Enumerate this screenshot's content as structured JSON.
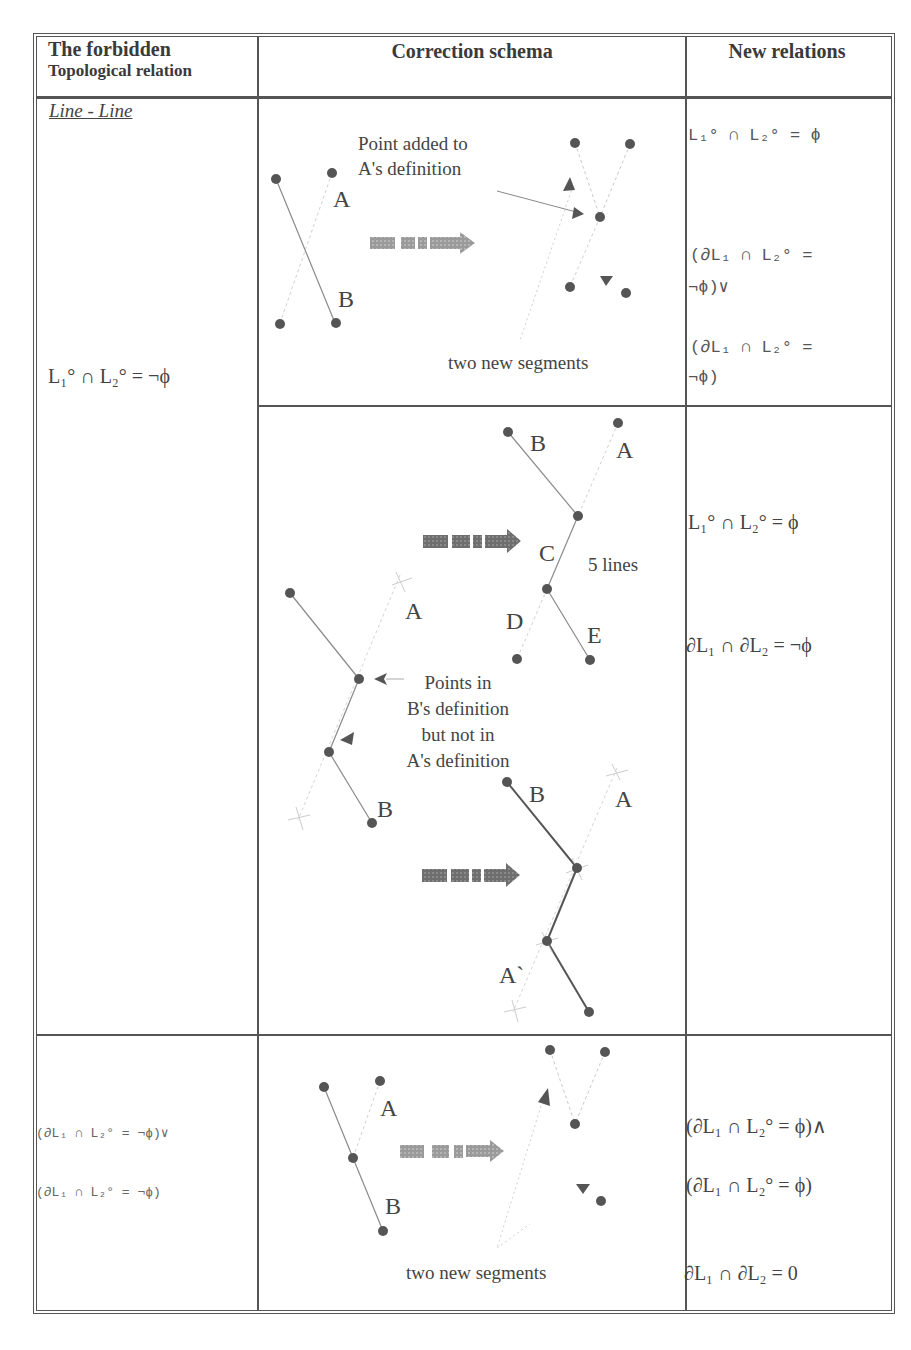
{
  "table": {
    "headers": {
      "col1_line1": "The forbidden",
      "col1_line2": "Topological relation",
      "col2": "Correction schema",
      "col3": "New relations"
    },
    "section_label": "Line - Line",
    "rows": [
      {
        "forbidden_relation": "L₁° ∩ L₂° = ¬ϕ",
        "schemas": [
          {
            "annotation_top": [
              "Point added to",
              "A's definition"
            ],
            "annotation_bottom": "two new segments",
            "labels": [
              "A",
              "B"
            ],
            "new_relations": [
              "L₁° ∩ L₂° = ϕ",
              "(∂L₁ ∩ L₂° =",
              "¬ϕ)∨",
              "(∂L₁ ∩ L₂° =",
              "¬ϕ)"
            ]
          },
          {
            "annotation_middle": [
              "Points in",
              "B's definition",
              "but not in",
              "A's definition"
            ],
            "annotation_lines": "5 lines",
            "labels_left": [
              "A",
              "B"
            ],
            "labels_top_right": [
              "B",
              "A",
              "C",
              "D",
              "E"
            ],
            "labels_bottom_right": [
              "B",
              "A",
              "A`"
            ],
            "new_relations": [
              "L₁° ∩ L₂° = ϕ",
              "∂L₁ ∩ ∂L₂ = ¬ϕ"
            ]
          }
        ]
      },
      {
        "forbidden_relation_lines": [
          "(∂L₁ ∩ L₂° = ¬ϕ)∨",
          "(∂L₁ ∩ L₂° = ¬ϕ)"
        ],
        "schema": {
          "annotation_bottom": "two new segments",
          "labels": [
            "A",
            "B"
          ]
        },
        "new_relations": [
          "(∂L₁ ∩ L₂° = ϕ)∧",
          "(∂L₁ ∩ L₂° = ϕ)",
          "∂L₁ ∩ ∂L₂ = 0"
        ]
      }
    ]
  },
  "colors": {
    "ink": "#3a3a3a",
    "border": "#555555",
    "point": "#555555",
    "line_solid": "#888888",
    "line_dashed": "#c8c8c8",
    "arrow_fill": "#999999"
  }
}
